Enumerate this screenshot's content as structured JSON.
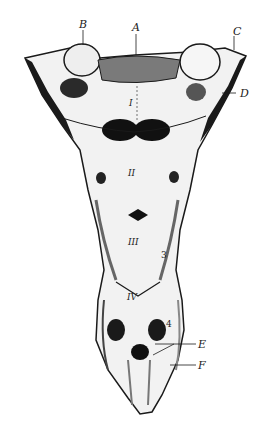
{
  "figure": {
    "labels": {
      "A": "A",
      "B": "B",
      "C": "C",
      "D": "D",
      "E": "E",
      "F": "F"
    },
    "vertebra_numerals": [
      "I",
      "II",
      "III",
      "IV"
    ],
    "foramen_numbers": [
      "3",
      "4"
    ],
    "colors": {
      "ink": "#1a1a1a",
      "bone": "#f4f4f4",
      "shade": "#8a8a8a"
    }
  }
}
